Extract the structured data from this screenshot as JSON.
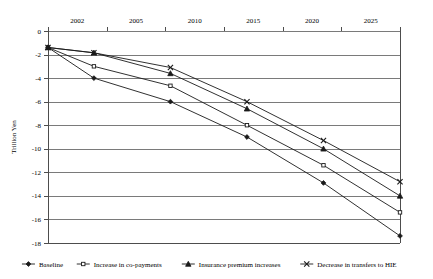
{
  "chart_data": {
    "type": "line",
    "title": "",
    "xlabel": "",
    "ylabel": "Trillion Yen",
    "x_tick_labels": [
      "2002",
      "2005",
      "2010",
      "2015",
      "2020",
      "2025"
    ],
    "y_tick_labels": [
      "0",
      "-2",
      "-4",
      "-6",
      "-8",
      "-10",
      "-12",
      "-14",
      "-16",
      "-18"
    ],
    "ylim": [
      -18,
      0
    ],
    "xlim": [
      2002,
      2025
    ],
    "grid": "horizontal",
    "legend_position": "bottom",
    "x": [
      2002,
      2005,
      2010,
      2015,
      2020,
      2025
    ],
    "series": [
      {
        "name": "Baseline",
        "marker": "diamond",
        "values": [
          -1.4,
          -4.0,
          -6.0,
          -9.0,
          -12.9,
          -17.4
        ]
      },
      {
        "name": "Increase in co-payments",
        "marker": "square-hollow",
        "values": [
          -1.4,
          -3.0,
          -4.65,
          -8.0,
          -11.4,
          -15.4
        ]
      },
      {
        "name": "Insurance premium increases",
        "marker": "triangle",
        "values": [
          -1.4,
          -1.85,
          -3.6,
          -6.6,
          -10.0,
          -14.0
        ]
      },
      {
        "name": "Decrease in transfers to HIE",
        "marker": "cross",
        "values": [
          -1.4,
          -1.85,
          -3.1,
          -6.0,
          -9.3,
          -12.8
        ]
      }
    ]
  },
  "legend": {
    "items": [
      {
        "label": "Baseline"
      },
      {
        "label": "Increase in co-payments"
      },
      {
        "label": "Insurance premium increases"
      },
      {
        "label": "Decrease in transfers to HIE"
      }
    ]
  }
}
